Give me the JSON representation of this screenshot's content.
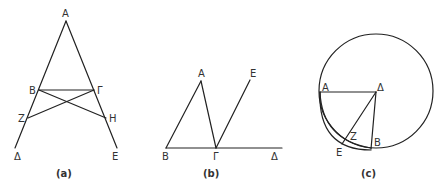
{
  "figures": [
    {
      "id": "a",
      "caption": "(a)",
      "points": {
        "A": "A",
        "B": "B",
        "Gamma": "Γ",
        "Z": "Z",
        "H": "H",
        "Delta": "Δ",
        "E": "E"
      },
      "segments": [
        "AΔ",
        "AE",
        "BΓ",
        "BH",
        "ΓZ"
      ]
    },
    {
      "id": "b",
      "caption": "(b)",
      "points": {
        "A": "A",
        "B": "B",
        "Gamma": "Γ",
        "Delta": "Δ",
        "E": "E"
      },
      "segments": [
        "BΔ",
        "BA",
        "AΓ",
        "ΓE"
      ]
    },
    {
      "id": "c",
      "caption": "(c)",
      "points": {
        "A": "A",
        "Delta": "Δ",
        "B": "B",
        "Z": "Z",
        "E": "E"
      },
      "segments": [
        "AΔ",
        "ΔB",
        "ΔE"
      ],
      "curves": [
        "circle centered at Δ",
        "arc AZB",
        "arc AEB"
      ]
    }
  ]
}
